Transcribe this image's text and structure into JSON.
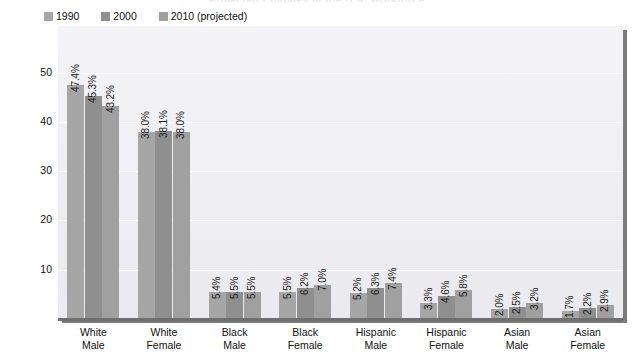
{
  "chart_data": {
    "type": "bar",
    "title": "Projected Changes in the U.S. Workforce",
    "xlabel": "",
    "ylabel": "Percentage of U.S. Workforce",
    "ylim": [
      0,
      55
    ],
    "yticks": [
      10,
      20,
      30,
      40,
      50
    ],
    "grid": true,
    "legend_position": "top-left",
    "categories": [
      "White Male",
      "White Female",
      "Black Male",
      "Black Female",
      "Hispanic Male",
      "Hispanic Female",
      "Asian Male",
      "Asian Female"
    ],
    "category_lines": [
      [
        "White",
        "Male"
      ],
      [
        "White",
        "Female"
      ],
      [
        "Black",
        "Male"
      ],
      [
        "Black",
        "Female"
      ],
      [
        "Hispanic",
        "Male"
      ],
      [
        "Hispanic",
        "Female"
      ],
      [
        "Asian",
        "Male"
      ],
      [
        "Asian",
        "Female"
      ]
    ],
    "series": [
      {
        "name": "1990",
        "color": "#a6a6a6",
        "values": [
          47.4,
          38.0,
          5.4,
          5.5,
          5.2,
          3.3,
          2.0,
          1.7
        ],
        "labels": [
          "47.4%",
          "38.0%",
          "5.4%",
          "5.5%",
          "5.2%",
          "3.3%",
          "2.0%",
          "1.7%"
        ]
      },
      {
        "name": "2000",
        "color": "#8f8f8f",
        "values": [
          45.3,
          38.1,
          5.5,
          6.2,
          6.3,
          4.6,
          2.5,
          2.2
        ],
        "labels": [
          "45.3%",
          "38.1%",
          "5.5%",
          "6.2%",
          "6.3%",
          "4.6%",
          "2.5%",
          "2.2%"
        ]
      },
      {
        "name": "2010 (projected)",
        "color": "#a0a0a0",
        "values": [
          43.2,
          38.0,
          5.5,
          7.0,
          7.4,
          5.8,
          3.2,
          2.9
        ],
        "labels": [
          "43.2%",
          "38.0%",
          "5.5%",
          "7.0%",
          "7.4%",
          "5.8%",
          "3.2%",
          "2.9%"
        ]
      }
    ]
  },
  "legend": {
    "items": [
      {
        "label": "1990",
        "color": "#a6a6a6"
      },
      {
        "label": "2000",
        "color": "#8f8f8f"
      },
      {
        "label": "2010 (projected)",
        "color": "#a0a0a0"
      }
    ]
  },
  "colors": {
    "plot_background": "#f1f1f4",
    "gridline": "#ffffff",
    "axis": "#6f6f6f",
    "shadow": "#7b7b7b",
    "text": "#111111"
  }
}
